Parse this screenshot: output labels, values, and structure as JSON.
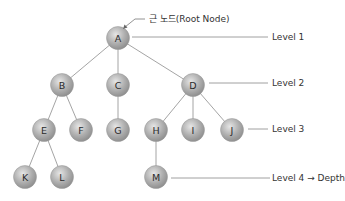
{
  "root_annotation": "근 노드(Root Node)",
  "nodes": [
    {
      "id": "A",
      "label": "A",
      "level": 1
    },
    {
      "id": "B",
      "label": "B",
      "level": 2
    },
    {
      "id": "C",
      "label": "C",
      "level": 2
    },
    {
      "id": "D",
      "label": "D",
      "level": 2
    },
    {
      "id": "E",
      "label": "E",
      "level": 3
    },
    {
      "id": "F",
      "label": "F",
      "level": 3
    },
    {
      "id": "G",
      "label": "G",
      "level": 3
    },
    {
      "id": "H",
      "label": "H",
      "level": 3
    },
    {
      "id": "I",
      "label": "I",
      "level": 3
    },
    {
      "id": "J",
      "label": "J",
      "level": 3
    },
    {
      "id": "K",
      "label": "K",
      "level": 4
    },
    {
      "id": "L",
      "label": "L",
      "level": 4
    },
    {
      "id": "M",
      "label": "M",
      "level": 4
    }
  ],
  "edges": [
    [
      "A",
      "B"
    ],
    [
      "A",
      "C"
    ],
    [
      "A",
      "D"
    ],
    [
      "B",
      "E"
    ],
    [
      "B",
      "F"
    ],
    [
      "C",
      "G"
    ],
    [
      "D",
      "H"
    ],
    [
      "D",
      "I"
    ],
    [
      "D",
      "J"
    ],
    [
      "E",
      "K"
    ],
    [
      "E",
      "L"
    ],
    [
      "H",
      "M"
    ]
  ],
  "levels": [
    {
      "label": "Level 1"
    },
    {
      "label": "Level 2"
    },
    {
      "label": "Level 3"
    },
    {
      "label": "Level 4 → Depth"
    }
  ],
  "colors": {
    "node_fill": "#a8a8a8",
    "edge": "#9a9a9a",
    "text": "#333333"
  }
}
